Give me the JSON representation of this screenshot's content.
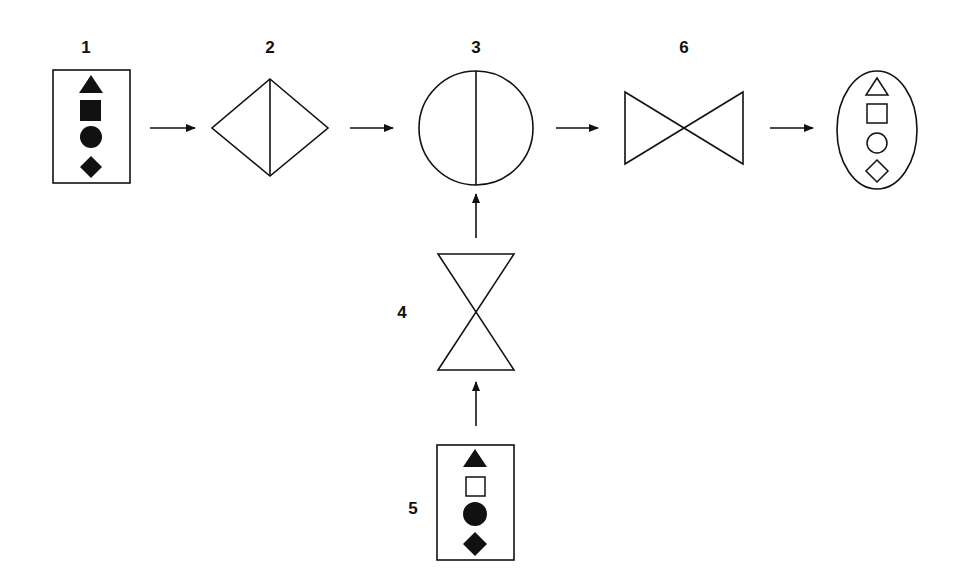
{
  "diagram": {
    "nodes": [
      {
        "id": "1",
        "label": "1",
        "shape": "rectangle-with-filled-shapes",
        "contents": [
          "filled-triangle",
          "filled-square",
          "filled-circle",
          "filled-diamond"
        ]
      },
      {
        "id": "2",
        "label": "2",
        "shape": "diamond-with-vertical-divider"
      },
      {
        "id": "3",
        "label": "3",
        "shape": "circle-with-vertical-divider"
      },
      {
        "id": "4",
        "label": "4",
        "shape": "hourglass"
      },
      {
        "id": "5",
        "label": "5",
        "shape": "rectangle-with-mixed-shapes",
        "contents": [
          "filled-triangle",
          "hollow-square",
          "filled-circle",
          "filled-diamond"
        ]
      },
      {
        "id": "6",
        "label": "6",
        "shape": "bowtie"
      },
      {
        "id": "output",
        "label": "",
        "shape": "ellipse-with-hollow-shapes",
        "contents": [
          "hollow-triangle",
          "hollow-square",
          "hollow-circle",
          "hollow-diamond"
        ]
      }
    ],
    "edges": [
      {
        "from": "1",
        "to": "2"
      },
      {
        "from": "2",
        "to": "3"
      },
      {
        "from": "3",
        "to": "6"
      },
      {
        "from": "6",
        "to": "output"
      },
      {
        "from": "5",
        "to": "4"
      },
      {
        "from": "4",
        "to": "3"
      }
    ]
  },
  "labels": {
    "n1": "1",
    "n2": "2",
    "n3": "3",
    "n4": "4",
    "n5": "5",
    "n6": "6"
  }
}
